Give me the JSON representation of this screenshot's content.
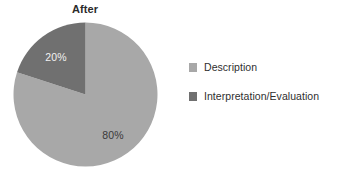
{
  "chart_data": {
    "type": "pie",
    "title": "After",
    "xlabel": "",
    "ylabel": "",
    "grid": false,
    "legend_position": "right",
    "categories": [
      "Description",
      "Interpretation/Evaluation"
    ],
    "values": [
      80,
      20
    ],
    "data_labels": [
      "80%",
      "20%"
    ],
    "colors": [
      "#a8a8a8",
      "#707070"
    ],
    "label_text_colors": [
      "#3a3a3a",
      "#f2f2f2"
    ],
    "start_angle_deg": 0,
    "direction": "clockwise",
    "slices": [
      {
        "name": "Description",
        "value": 80,
        "label": "80%",
        "color": "#a8a8a8",
        "start_deg": 0,
        "end_deg": 288
      },
      {
        "name": "Interpretation/Evaluation",
        "value": 20,
        "label": "20%",
        "color": "#707070",
        "start_deg": 288,
        "end_deg": 360
      }
    ]
  },
  "chart": {
    "title": "After",
    "background": "#ffffff"
  },
  "pie": {
    "description": {
      "label": "80%",
      "color": "#a8a8a8"
    },
    "interpretation": {
      "label": "20%",
      "color": "#707070"
    }
  },
  "legend": {
    "items": [
      {
        "label": "Description",
        "color": "#a8a8a8"
      },
      {
        "label": "Interpretation/Evaluation",
        "color": "#707070"
      }
    ]
  }
}
